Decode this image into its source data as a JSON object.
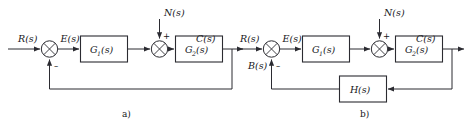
{
  "figure": {
    "background_color": "#ffffff",
    "line_color": "#2b2b31",
    "text_color": "#16161a"
  },
  "diagrams": [
    {
      "id": "a",
      "caption": "a)",
      "description": "Open-loop forward path with unity feedback and disturbance input",
      "signals": {
        "input": "R(s)",
        "error": "E(s)",
        "disturbance": "N(s)",
        "output": "C(s)"
      },
      "blocks": [
        {
          "name": "G1",
          "label": "G",
          "subscript": "1",
          "arg": "(s)"
        },
        {
          "name": "G2",
          "label": "G",
          "subscript": "2",
          "arg": "(s)"
        }
      ],
      "junctions": [
        {
          "name": "error-junction",
          "signs": [
            "-"
          ]
        },
        {
          "name": "disturbance-junction",
          "signs": [
            "+"
          ]
        }
      ],
      "feedback": "unity"
    },
    {
      "id": "b",
      "caption": "b)",
      "description": "Closed-loop system with feedback transfer function H(s) and disturbance input",
      "signals": {
        "input": "R(s)",
        "error": "E(s)",
        "feedback": "B(s)",
        "disturbance": "N(s)",
        "output": "C(s)"
      },
      "blocks": [
        {
          "name": "G1",
          "label": "G",
          "subscript": "1",
          "arg": "(s)"
        },
        {
          "name": "G2",
          "label": "G",
          "subscript": "2",
          "arg": "(s)"
        },
        {
          "name": "H",
          "label": "H",
          "subscript": "",
          "arg": "(s)"
        }
      ],
      "junctions": [
        {
          "name": "error-junction",
          "signs": [
            "-"
          ]
        },
        {
          "name": "disturbance-junction",
          "signs": [
            "+"
          ]
        }
      ],
      "feedback": "H(s)"
    }
  ],
  "labels": {
    "a_R": "R(s)",
    "a_E": "E(s)",
    "a_N": "N(s)",
    "a_C": "C(s)",
    "a_minus": "–",
    "a_plus": "+",
    "a_G1_main": "G",
    "a_G1_sub": "1",
    "a_G1_arg": "(s)",
    "a_G2_main": "G",
    "a_G2_sub": "2",
    "a_G2_arg": "(s)",
    "a_caption": "a)",
    "b_R": "R(s)",
    "b_E": "E(s)",
    "b_B": "B(s)",
    "b_N": "N(s)",
    "b_C": "C(s)",
    "b_minus": "–",
    "b_plus": "+",
    "b_G1_main": "G",
    "b_G1_sub": "1",
    "b_G1_arg": "(s)",
    "b_G2_main": "G",
    "b_G2_sub": "2",
    "b_G2_arg": "(s)",
    "b_H_main": "H",
    "b_H_arg": "(s)",
    "b_caption": "b)"
  }
}
